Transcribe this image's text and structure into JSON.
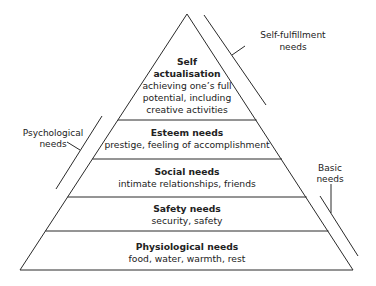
{
  "diagram": {
    "type": "pyramid",
    "colors": {
      "line": "#2a2a2a",
      "text": "#222222",
      "background": "#ffffff"
    },
    "levels": [
      {
        "id": "self-actualisation",
        "title_lines": [
          "Self",
          "actualisation"
        ],
        "desc_lines": [
          "achieving one’s full",
          "potential, including",
          "creative activities"
        ]
      },
      {
        "id": "esteem",
        "title_lines": [
          "Esteem needs"
        ],
        "desc_lines": [
          "prestige, feeling of accomplishment"
        ]
      },
      {
        "id": "social",
        "title_lines": [
          "Social needs"
        ],
        "desc_lines": [
          "intimate relationships, friends"
        ]
      },
      {
        "id": "safety",
        "title_lines": [
          "Safety needs"
        ],
        "desc_lines": [
          "security, safety"
        ]
      },
      {
        "id": "physiological",
        "title_lines": [
          "Physiological needs"
        ],
        "desc_lines": [
          "food, water, warmth, rest"
        ]
      }
    ],
    "groups": [
      {
        "id": "self-fulfillment",
        "label_lines": [
          "Self-fulfillment",
          "needs"
        ]
      },
      {
        "id": "psychological",
        "label_lines": [
          "Psychological",
          "needs"
        ]
      },
      {
        "id": "basic",
        "label_lines": [
          "Basic",
          "needs"
        ]
      }
    ]
  }
}
